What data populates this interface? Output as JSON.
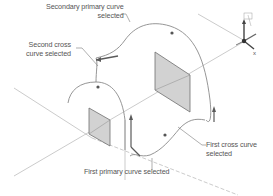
{
  "figure": {
    "type": "3D loft surface construction diagram",
    "colors": {
      "line": "#9a9a9a",
      "curve": "#8a8a8a",
      "plane_fill": "#d4d4d4",
      "plane_edge": "#6e6e6e",
      "text": "#555555",
      "arrow": "#5a5a5a"
    }
  },
  "labels": {
    "secondary_primary": {
      "line1": "Secondary primary curve",
      "line2": "selected"
    },
    "second_cross": {
      "line1": "Second cross",
      "line2": "curve selected"
    },
    "first_primary": {
      "line1": "First primary curve selected"
    },
    "first_cross": {
      "line1": "First cross curve",
      "line2": "selected"
    }
  },
  "axis_indicator": {
    "labels": [
      "Z",
      "Y",
      "X"
    ],
    "x_label": "x"
  }
}
